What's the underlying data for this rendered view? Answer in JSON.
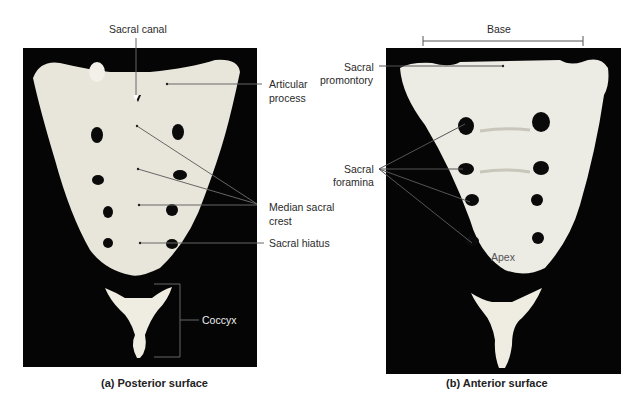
{
  "figure": {
    "panels": [
      {
        "id": "a",
        "caption": "(a) Posterior surface",
        "labels": {
          "sacral_canal": "Sacral canal",
          "articular_process_1": "Articular",
          "articular_process_2": "process",
          "median_sacral_crest_1": "Median sacral",
          "median_sacral_crest_2": "crest",
          "sacral_hiatus": "Sacral hiatus",
          "coccyx": "Coccyx"
        }
      },
      {
        "id": "b",
        "caption": "(b) Anterior surface",
        "labels": {
          "base": "Base",
          "sacral_promontory_1": "Sacral",
          "sacral_promontory_2": "promontory",
          "sacral_foramina_1": "Sacral",
          "sacral_foramina_2": "foramina",
          "apex": "Apex"
        }
      }
    ],
    "colors": {
      "background": "#050505",
      "bone": "#e9e6dc",
      "leader": "#666666"
    }
  }
}
